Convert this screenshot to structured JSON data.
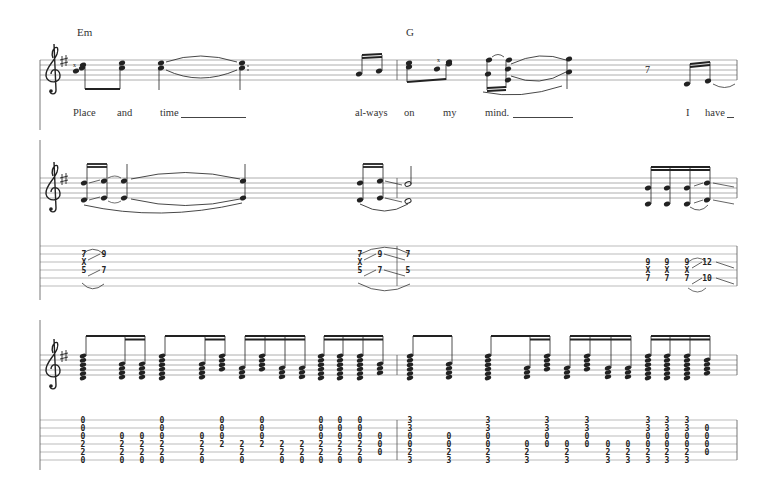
{
  "score": {
    "key_signature": "G major (1 sharp)",
    "clef": "treble",
    "chords": [
      {
        "name": "Em",
        "x": 77
      },
      {
        "name": "G",
        "x": 406
      }
    ],
    "lyrics": [
      {
        "text": "Place",
        "x": 73
      },
      {
        "text": "and",
        "x": 117
      },
      {
        "text": "time",
        "x": 160
      },
      {
        "text": "al-ways",
        "x": 355
      },
      {
        "text": "on",
        "x": 404
      },
      {
        "text": "my",
        "x": 443
      },
      {
        "text": "mind.",
        "x": 485
      },
      {
        "text": "I",
        "x": 686
      },
      {
        "text": "have",
        "x": 705
      }
    ],
    "system2_tab": [
      {
        "x": 84,
        "strings": {
          "2": "7",
          "3": "X",
          "4": "5"
        }
      },
      {
        "x": 104,
        "strings": {
          "2": "9",
          "4": "7"
        }
      },
      {
        "x": 360,
        "strings": {
          "2": "7",
          "3": "X",
          "4": "5"
        }
      },
      {
        "x": 380,
        "strings": {
          "2": "9",
          "4": "7"
        }
      },
      {
        "x": 408,
        "strings": {
          "2": "7",
          "4": "5"
        }
      },
      {
        "x": 648,
        "strings": {
          "3": "9",
          "4": "X",
          "5": "7"
        }
      },
      {
        "x": 667,
        "strings": {
          "3": "9",
          "4": "X",
          "5": "7"
        }
      },
      {
        "x": 687,
        "strings": {
          "3": "9",
          "4": "X",
          "5": "7"
        }
      },
      {
        "x": 707,
        "strings": {
          "3": "12",
          "5": "10"
        }
      }
    ],
    "system3_tab": [
      {
        "x": 83,
        "frets": [
          "0",
          "0",
          "0",
          "2",
          "2",
          "0"
        ]
      },
      {
        "x": 122,
        "frets": [
          "",
          "",
          "0",
          "2",
          "2",
          "0"
        ]
      },
      {
        "x": 142,
        "frets": [
          "",
          "",
          "0",
          "2",
          "2",
          "0"
        ]
      },
      {
        "x": 162,
        "frets": [
          "0",
          "0",
          "0",
          "2",
          "2",
          "0"
        ]
      },
      {
        "x": 202,
        "frets": [
          "",
          "",
          "0",
          "2",
          "2",
          "0"
        ]
      },
      {
        "x": 222,
        "frets": [
          "0",
          "0",
          "0",
          "2",
          "",
          ""
        ]
      },
      {
        "x": 242,
        "frets": [
          "",
          "",
          "",
          "2",
          "2",
          "0"
        ]
      },
      {
        "x": 262,
        "frets": [
          "0",
          "0",
          "0",
          "2",
          "",
          ""
        ]
      },
      {
        "x": 282,
        "frets": [
          "",
          "",
          "",
          "2",
          "2",
          "0"
        ]
      },
      {
        "x": 302,
        "frets": [
          "",
          "",
          "",
          "2",
          "2",
          "0"
        ]
      },
      {
        "x": 321,
        "frets": [
          "0",
          "0",
          "0",
          "2",
          "2",
          "0"
        ]
      },
      {
        "x": 340,
        "frets": [
          "0",
          "0",
          "0",
          "2",
          "2",
          "0"
        ]
      },
      {
        "x": 360,
        "frets": [
          "0",
          "0",
          "0",
          "2",
          "2",
          "0"
        ]
      },
      {
        "x": 380,
        "frets": [
          "",
          "",
          "0",
          "0",
          "0",
          ""
        ]
      },
      {
        "x": 410,
        "frets": [
          "3",
          "3",
          "0",
          "0",
          "2",
          "3"
        ]
      },
      {
        "x": 449,
        "frets": [
          "",
          "",
          "0",
          "0",
          "2",
          "3"
        ]
      },
      {
        "x": 488,
        "frets": [
          "3",
          "3",
          "0",
          "0",
          "2",
          "3"
        ]
      },
      {
        "x": 527,
        "frets": [
          "",
          "",
          "",
          "0",
          "2",
          "3"
        ]
      },
      {
        "x": 547,
        "frets": [
          "3",
          "3",
          "0",
          "0",
          "",
          ""
        ]
      },
      {
        "x": 567,
        "frets": [
          "",
          "",
          "",
          "0",
          "2",
          "3"
        ]
      },
      {
        "x": 587,
        "frets": [
          "3",
          "3",
          "0",
          "0",
          "",
          ""
        ]
      },
      {
        "x": 608,
        "frets": [
          "",
          "",
          "",
          "0",
          "2",
          "3"
        ]
      },
      {
        "x": 628,
        "frets": [
          "",
          "",
          "",
          "0",
          "2",
          "3"
        ]
      },
      {
        "x": 648,
        "frets": [
          "3",
          "3",
          "0",
          "0",
          "2",
          "3"
        ]
      },
      {
        "x": 667,
        "frets": [
          "3",
          "3",
          "0",
          "0",
          "2",
          "3"
        ]
      },
      {
        "x": 687,
        "frets": [
          "3",
          "3",
          "0",
          "0",
          "2",
          "3"
        ]
      },
      {
        "x": 707,
        "frets": [
          "",
          "0",
          "0",
          "0",
          "0",
          ""
        ]
      }
    ]
  }
}
